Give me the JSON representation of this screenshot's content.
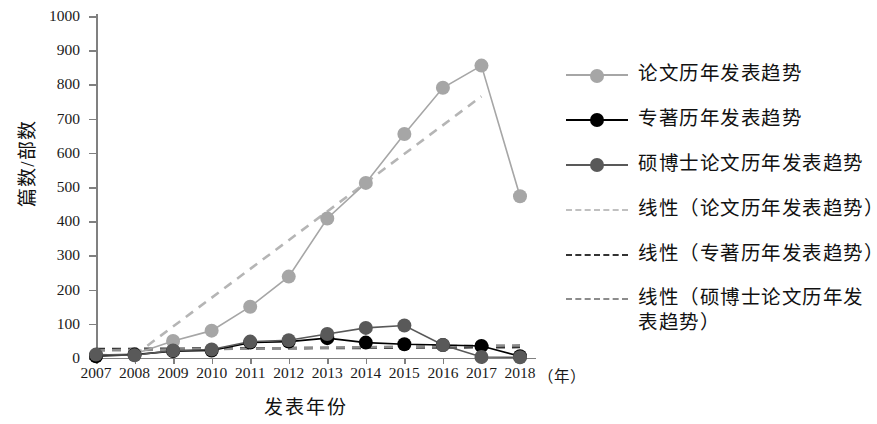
{
  "chart_data": {
    "type": "line",
    "title": "",
    "xlabel": "发表年份",
    "ylabel": "篇数/部数",
    "x_unit": "（年）",
    "categories": [
      "2007",
      "2008",
      "2009",
      "2010",
      "2011",
      "2012",
      "2013",
      "2014",
      "2015",
      "2016",
      "2017",
      "2018"
    ],
    "ylim": [
      0,
      1000
    ],
    "yticks": [
      0,
      100,
      200,
      300,
      400,
      500,
      600,
      700,
      800,
      900,
      1000
    ],
    "grid": false,
    "legend_position": "right",
    "series": [
      {
        "name": "论文历年发表趋势",
        "color": "#a6a6a6",
        "style": "solid-marker",
        "values": [
          8,
          12,
          50,
          80,
          150,
          238,
          408,
          512,
          655,
          790,
          855,
          473
        ]
      },
      {
        "name": "专著历年发表趋势",
        "color": "#000000",
        "style": "solid-marker",
        "values": [
          5,
          10,
          20,
          22,
          45,
          48,
          58,
          45,
          40,
          38,
          35,
          5
        ]
      },
      {
        "name": "硕博士论文历年发表趋势",
        "color": "#595959",
        "style": "solid-marker",
        "values": [
          10,
          8,
          22,
          25,
          48,
          52,
          70,
          88,
          95,
          38,
          3,
          2
        ]
      }
    ],
    "trendlines": [
      {
        "name": "线性（论文历年发表趋势）",
        "color": "#b5b5b5",
        "style": "dashed",
        "start": {
          "x": "2008",
          "y": 8
        },
        "end": {
          "x": "2017",
          "y": 765
        }
      },
      {
        "name": "线性（专著历年发表趋势）",
        "color": "#333333",
        "style": "dashed",
        "start": {
          "x": "2007",
          "y": 26
        },
        "end": {
          "x": "2018",
          "y": 32
        }
      },
      {
        "name": "线性（硕博士论文历年发表趋势）",
        "color": "#8c8c8c",
        "style": "dashed",
        "start": {
          "x": "2007",
          "y": 22
        },
        "end": {
          "x": "2018",
          "y": 37
        }
      }
    ]
  },
  "axes": {
    "y_title": "篇数/部数",
    "x_title": "发表年份",
    "x_unit": "（年）",
    "y_tick_labels": [
      "1000",
      "900",
      "800",
      "700",
      "600",
      "500",
      "400",
      "300",
      "200",
      "100",
      "0"
    ],
    "x_tick_labels": [
      "2007",
      "2008",
      "2009",
      "2010",
      "2011",
      "2012",
      "2013",
      "2014",
      "2015",
      "2016",
      "2017",
      "2018"
    ]
  },
  "legend": {
    "items": [
      {
        "label": "论文历年发表趋势",
        "color": "#a6a6a6",
        "kind": "line-marker"
      },
      {
        "label": "专著历年发表趋势",
        "color": "#000000",
        "kind": "line-marker"
      },
      {
        "label": "硕博士论文历年发表趋势",
        "color": "#595959",
        "kind": "line-marker"
      },
      {
        "label": "线性（论文历年发表趋势）",
        "color": "#c0c0c0",
        "kind": "dashed"
      },
      {
        "label": "线性（专著历年发表趋势）",
        "color": "#333333",
        "kind": "dashed"
      },
      {
        "label": "线性（硕博士论文历年发表\n表趋势）",
        "color": "#8c8c8c",
        "kind": "dashed"
      }
    ],
    "item6_line1": "线性（硕博士论文历年发",
    "item6_line2": "表趋势）"
  }
}
